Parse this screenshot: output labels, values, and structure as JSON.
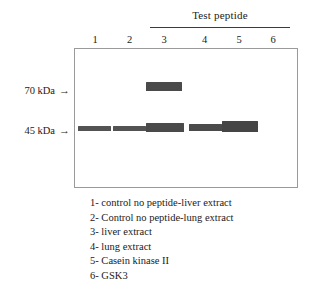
{
  "figure": {
    "type": "western-blot-gel",
    "group_header": {
      "label": "Test peptide",
      "spans_lanes": [
        3,
        4,
        5,
        6
      ]
    },
    "lanes": [
      {
        "number": "1"
      },
      {
        "number": "2"
      },
      {
        "number": "3"
      },
      {
        "number": "4"
      },
      {
        "number": "5"
      },
      {
        "number": "6"
      }
    ],
    "markers": [
      {
        "label": "70 kDa",
        "arrow": "→"
      },
      {
        "label": "45 kDa",
        "arrow": "→"
      }
    ],
    "bands": [
      {
        "marker": "70 kDa",
        "lane": 3,
        "intensity": "mid"
      },
      {
        "marker": "45 kDa",
        "lane": 1,
        "intensity": "dim"
      },
      {
        "marker": "45 kDa",
        "lane": 2,
        "intensity": "dim"
      },
      {
        "marker": "45 kDa",
        "lane": 3,
        "intensity": "mid"
      },
      {
        "marker": "45 kDa",
        "lane": 4,
        "intensity": "mid"
      },
      {
        "marker": "45 kDa",
        "lane": 5,
        "intensity": "dark"
      }
    ],
    "legend": [
      "1- control no peptide-liver extract",
      "2- Control no peptide-lung extract",
      "3- liver extract",
      "4- lung extract",
      "5- Casein kinase II",
      "6- GSK3"
    ],
    "colors": {
      "band": "#4c4c4c",
      "box_border": "#9a9a9a",
      "rule": "#3a3a3a",
      "text": "#1a1a1a",
      "background": "#ffffff"
    }
  },
  "chart_data": {
    "type": "heatmap",
    "title": "Test peptide",
    "xlabel": "",
    "ylabel": "",
    "categories": [
      "1",
      "2",
      "3",
      "4",
      "5",
      "6"
    ],
    "rows": [
      "70 kDa",
      "45 kDa"
    ],
    "series": [
      {
        "name": "70 kDa",
        "values": [
          0,
          0,
          1,
          0,
          0,
          0
        ]
      },
      {
        "name": "45 kDa",
        "values": [
          1,
          1,
          1,
          1,
          1,
          0
        ]
      }
    ],
    "annotations": [
      "1- control no peptide-liver extract",
      "2- Control no peptide-lung extract",
      "3- liver extract",
      "4- lung extract",
      "5- Casein kinase II",
      "6- GSK3"
    ],
    "grid": false,
    "legend_position": "below"
  }
}
